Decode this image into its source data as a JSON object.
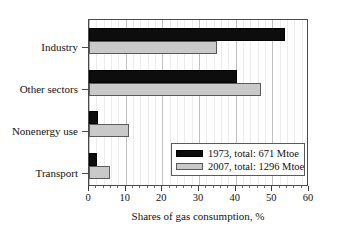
{
  "chart_data": {
    "type": "bar",
    "orientation": "horizontal",
    "title": "",
    "xlabel": "Shares of gas consumption, %",
    "ylabel": "",
    "xlim": [
      0,
      60
    ],
    "xticks": [
      0,
      10,
      20,
      30,
      40,
      50,
      60
    ],
    "xtick_labels": [
      "0",
      "10",
      "20",
      "30",
      "40",
      "50",
      "60"
    ],
    "minor_tick_step": 2,
    "grid": "vertical-major-and-minor",
    "legend_position": "lower-right-inside",
    "categories": [
      "Industry",
      "Other sectors",
      "Nonenergy use",
      "Transport"
    ],
    "series": [
      {
        "name": "1973, total: 671 Mtoe",
        "year": "1973",
        "total": "671 Mtoe",
        "color": "#0d0d0d",
        "values": [
          53.5,
          40.4,
          2.5,
          2.3
        ]
      },
      {
        "name": "2007, total: 1296 Mtoe",
        "year": "2007",
        "total": "1296 Mtoe",
        "color": "#c9c9c9",
        "values": [
          35.0,
          47.0,
          11.0,
          5.7
        ]
      }
    ]
  },
  "legend": {
    "entries": [
      {
        "label": "1973, total: 671 Mtoe"
      },
      {
        "label": "2007, total: 1296 Mtoe"
      }
    ]
  },
  "axis": {
    "x_title": "Shares of gas consumption, %",
    "x_tick_labels": [
      "0",
      "10",
      "20",
      "30",
      "40",
      "50",
      "60"
    ],
    "y_category_labels": [
      "Industry",
      "Other sectors",
      "Nonenergy use",
      "Transport"
    ]
  }
}
